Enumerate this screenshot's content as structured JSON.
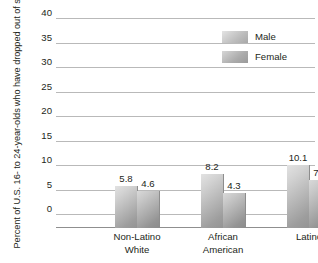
{
  "chart_data": {
    "type": "bar",
    "title": "",
    "xlabel": "",
    "ylabel_line1": "Percent of U.S. 16- to 24-year-olds",
    "ylabel_line2": "who have dropped out of school",
    "categories": [
      "Non-Latino White",
      "African American",
      "Latino"
    ],
    "category_lines": [
      [
        "Non-Latino",
        "White"
      ],
      [
        "African",
        "American"
      ],
      [
        "Latino",
        ""
      ]
    ],
    "series": [
      {
        "name": "Male",
        "values": [
          5.8,
          8.2,
          10.1
        ],
        "value_labels": [
          "5.8",
          "8.2",
          "10.1"
        ],
        "color": "#c3c3c3"
      },
      {
        "name": "Female",
        "values": [
          4.6,
          4.3,
          7.0
        ],
        "value_labels": [
          "4.6",
          "4.3",
          "7.0"
        ],
        "color": "#b0b0b0"
      }
    ],
    "ylim": [
      0,
      40
    ],
    "ytick_values": [
      40,
      35,
      30,
      25,
      20,
      15,
      10,
      5,
      0
    ],
    "ytick_labels": [
      "40",
      "35",
      "30",
      "25",
      "20",
      "15",
      "10",
      "5",
      "0"
    ],
    "grid": true,
    "grid_color": "#b9b9b9",
    "legend_position": "top-right",
    "background": "#ffffff"
  },
  "legend": {
    "entries": [
      {
        "label": "Male"
      },
      {
        "label": "Female"
      }
    ]
  }
}
